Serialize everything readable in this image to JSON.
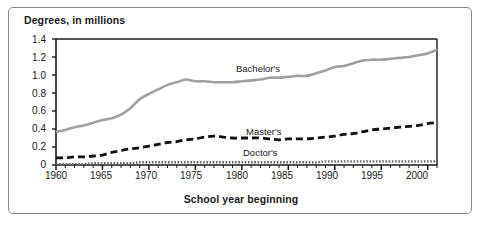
{
  "chart_data": {
    "type": "line",
    "title": "",
    "ylabel": "Degrees, in millions",
    "xlabel": "School year beginning",
    "xlim": [
      1960,
      2001
    ],
    "ylim": [
      0,
      1.4
    ],
    "grid": false,
    "legend_position": "inline-annotations",
    "ytick_labels": [
      "1.4",
      "1.2",
      "1.0",
      "0.8",
      "0.6",
      "0.4",
      "0.2",
      "0"
    ],
    "ytick_values": [
      1.4,
      1.2,
      1.0,
      0.8,
      0.6,
      0.4,
      0.2,
      0
    ],
    "xtick_labels": [
      "1960",
      "1965",
      "1970",
      "1975",
      "1980",
      "1985",
      "1990",
      "1995",
      "2000"
    ],
    "xtick_values": [
      1960,
      1965,
      1970,
      1975,
      1980,
      1985,
      1990,
      1995,
      2000
    ],
    "x": [
      1960,
      1961,
      1962,
      1963,
      1964,
      1965,
      1966,
      1967,
      1968,
      1969,
      1970,
      1971,
      1972,
      1973,
      1974,
      1975,
      1976,
      1977,
      1978,
      1979,
      1980,
      1981,
      1982,
      1983,
      1984,
      1985,
      1986,
      1987,
      1988,
      1989,
      1990,
      1991,
      1992,
      1993,
      1994,
      1995,
      1996,
      1997,
      1998,
      1999,
      2000,
      2001
    ],
    "series": [
      {
        "name": "Bachelor's",
        "label": "Bachelor's",
        "color": "#a0a0a0",
        "style": "solid",
        "values": [
          0.37,
          0.39,
          0.42,
          0.44,
          0.47,
          0.5,
          0.52,
          0.56,
          0.63,
          0.73,
          0.79,
          0.84,
          0.89,
          0.92,
          0.95,
          0.93,
          0.93,
          0.92,
          0.92,
          0.92,
          0.93,
          0.94,
          0.95,
          0.97,
          0.97,
          0.98,
          0.99,
          0.99,
          1.02,
          1.05,
          1.09,
          1.1,
          1.13,
          1.16,
          1.17,
          1.17,
          1.18,
          1.19,
          1.2,
          1.22,
          1.24,
          1.28
        ]
      },
      {
        "name": "Master's",
        "label": "Master's",
        "color": "#111111",
        "style": "dashed",
        "values": [
          0.08,
          0.08,
          0.09,
          0.09,
          0.1,
          0.11,
          0.14,
          0.16,
          0.18,
          0.19,
          0.21,
          0.23,
          0.25,
          0.26,
          0.28,
          0.29,
          0.31,
          0.32,
          0.31,
          0.3,
          0.3,
          0.3,
          0.3,
          0.29,
          0.28,
          0.29,
          0.29,
          0.29,
          0.3,
          0.31,
          0.32,
          0.34,
          0.35,
          0.37,
          0.39,
          0.4,
          0.41,
          0.42,
          0.43,
          0.44,
          0.46,
          0.47
        ]
      },
      {
        "name": "Doctor's",
        "label": "Doctor's",
        "color": "#666666",
        "style": "dotted",
        "values": [
          0.01,
          0.01,
          0.01,
          0.01,
          0.02,
          0.02,
          0.02,
          0.02,
          0.02,
          0.03,
          0.03,
          0.03,
          0.03,
          0.03,
          0.03,
          0.03,
          0.03,
          0.03,
          0.03,
          0.03,
          0.03,
          0.03,
          0.03,
          0.03,
          0.03,
          0.03,
          0.03,
          0.03,
          0.03,
          0.04,
          0.04,
          0.04,
          0.04,
          0.04,
          0.04,
          0.04,
          0.04,
          0.04,
          0.04,
          0.04,
          0.04,
          0.04
        ]
      }
    ]
  }
}
